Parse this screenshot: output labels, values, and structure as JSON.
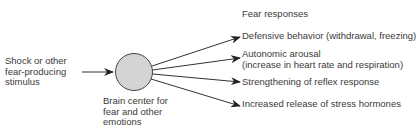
{
  "diagram": {
    "input": {
      "lines": [
        "Shock or other",
        "fear-producing",
        "stimulus"
      ]
    },
    "center": {
      "lines": [
        "Brain center for",
        "fear and other",
        "emotions"
      ],
      "fill": "#d4d4d4"
    },
    "outputs_header": "Fear responses",
    "outputs": [
      {
        "lines": [
          "Defensive behavior (withdrawal, freezing)"
        ]
      },
      {
        "lines": [
          "Autonomic arousal",
          "(increase in heart rate and respiration)"
        ]
      },
      {
        "lines": [
          "Strengthening of reflex response"
        ]
      },
      {
        "lines": [
          "Increased release of stress hormones"
        ]
      }
    ]
  }
}
